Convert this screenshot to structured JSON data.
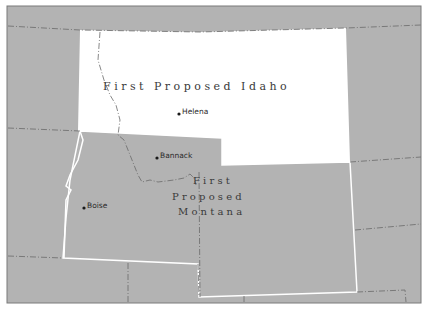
{
  "map": {
    "colors": {
      "background": "#b3b3b3",
      "highlight_territory": "#ffffff",
      "border_white": "#ffffff",
      "border_dashed": "#6a6a6a",
      "frame": "#7a7a7a",
      "text": "#3a3a3a",
      "city_dot": "#1a1a1a"
    },
    "regions": [
      {
        "id": "first-proposed-idaho",
        "label": "First Proposed Idaho",
        "fill": "#ffffff"
      },
      {
        "id": "first-proposed-montana",
        "label_lines": [
          "First",
          "Proposed",
          "Montana"
        ],
        "fill": "#b3b3b3"
      }
    ],
    "labels": {
      "idaho": "F i r s t   P r o p o s e d   I d a h o",
      "montana_line1": "F i r s t",
      "montana_line2": "P r o p o s e d",
      "montana_line3": "M o n t a n a"
    },
    "cities": [
      {
        "name": "Helena",
        "x": 179,
        "y": 114
      },
      {
        "name": "Bannack",
        "x": 157,
        "y": 158
      },
      {
        "name": "Boise",
        "x": 84,
        "y": 208
      }
    ]
  }
}
